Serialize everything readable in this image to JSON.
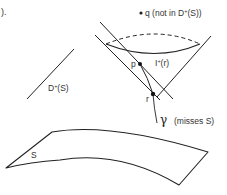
{
  "figure": {
    "caption_fragment": ").",
    "labels": {
      "q_point": "q (not in D",
      "q_point_sup": "+",
      "q_point_tail": "(S))",
      "domain_label": "D",
      "domain_label_sup": "+",
      "domain_label_tail": "(S)",
      "point_p": "p",
      "future_set": "I",
      "future_set_sup": "+",
      "future_set_tail": "(r)",
      "point_r": "r",
      "curve_gamma": "γ",
      "curve_gamma_note": "(misses S)",
      "surface_S": "S"
    },
    "colors": {
      "stroke": "#222222",
      "text": "#333333",
      "background": "#ffffff"
    }
  }
}
